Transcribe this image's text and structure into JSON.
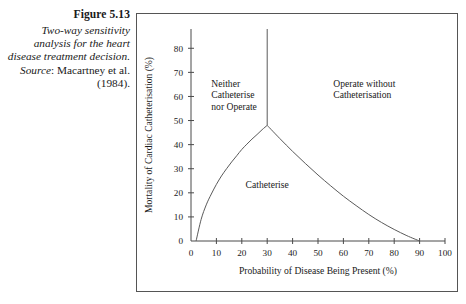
{
  "caption": {
    "figure_number": "Figure 5.13",
    "description": "Two-way sensitivity analysis for the heart disease treatment decision.",
    "source_word": "Source",
    "source_separator": ": ",
    "source_reference": "Macartney et al. (1984)."
  },
  "chart_data": {
    "type": "line",
    "title": "",
    "xlabel": "Probability of Disease Being Present (%)",
    "ylabel": "Mortality of Cardiac Catheterisation (%)",
    "xlim": [
      0,
      100
    ],
    "ylim": [
      0,
      88
    ],
    "grid": false,
    "legend": "none",
    "xticks": [
      0,
      10,
      20,
      30,
      40,
      50,
      60,
      70,
      80,
      90,
      100
    ],
    "xtick_labels": [
      "0",
      "10",
      "20",
      "30",
      "40",
      "50",
      "60",
      "70",
      "80",
      "90",
      "100"
    ],
    "yticks": [
      0,
      10,
      20,
      30,
      40,
      50,
      60,
      70,
      80
    ],
    "ytick_labels": [
      "0",
      "10",
      "20",
      "30",
      "40",
      "50",
      "60",
      "70",
      "80"
    ],
    "series": [
      {
        "name": "rising-boundary",
        "description": "Lower-left boundary rising from origin region to the peak",
        "points": [
          [
            2,
            0
          ],
          [
            4,
            9
          ],
          [
            6,
            15
          ],
          [
            8,
            19.5
          ],
          [
            10,
            23.5
          ],
          [
            12,
            27
          ],
          [
            14,
            30
          ],
          [
            16,
            32.8
          ],
          [
            18,
            35.4
          ],
          [
            20,
            38
          ],
          [
            22,
            40.2
          ],
          [
            24,
            42.3
          ],
          [
            26,
            44.2
          ],
          [
            28,
            46.2
          ],
          [
            30,
            48
          ]
        ]
      },
      {
        "name": "falling-boundary",
        "description": "Boundary descending from the peak to the x-axis at 90%",
        "points": [
          [
            30,
            48
          ],
          [
            35,
            42.5
          ],
          [
            40,
            37.2
          ],
          [
            45,
            32.2
          ],
          [
            50,
            27.4
          ],
          [
            55,
            22.9
          ],
          [
            60,
            18.6
          ],
          [
            65,
            14.7
          ],
          [
            70,
            11.0
          ],
          [
            75,
            7.7
          ],
          [
            80,
            4.8
          ],
          [
            85,
            2.2
          ],
          [
            90,
            0
          ]
        ]
      },
      {
        "name": "vertical-boundary",
        "description": "Vertical divider at 30% from the peak to the top of the plot",
        "points": [
          [
            30,
            48
          ],
          [
            30,
            88
          ]
        ]
      }
    ],
    "annotations": [
      {
        "text": "Neither\nCatheterise\nnor Operate",
        "x": 8,
        "y": 64,
        "align": "left"
      },
      {
        "text": "Operate without\nCatheterisation",
        "x": 56,
        "y": 64,
        "align": "left"
      },
      {
        "text": "Catheterise",
        "x": 30,
        "y": 22,
        "align": "center"
      }
    ],
    "region_labels": {
      "neither": [
        "Neither",
        "Catheterise",
        "nor Operate"
      ],
      "operate": [
        "Operate without",
        "Catheterisation"
      ],
      "catheterise": "Catheterise"
    }
  }
}
